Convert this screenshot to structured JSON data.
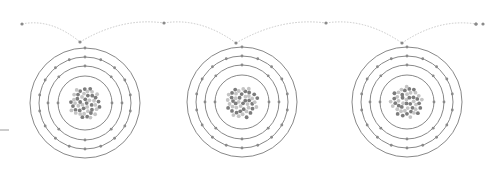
{
  "diagram": {
    "colors": {
      "background": "#ffffff",
      "orbit": "#7a7a7a",
      "path": "#c8c8c8",
      "electron": "#8a8a8a",
      "proton": "#7c7c7c",
      "neutron": "#c4c4c4"
    },
    "atoms": [
      {
        "cx": 85,
        "cy": 103
      },
      {
        "cx": 242,
        "cy": 102
      },
      {
        "cx": 407,
        "cy": 102
      }
    ],
    "shells": [
      {
        "r": 27,
        "electrons": 2
      },
      {
        "r": 37,
        "electrons": 8
      },
      {
        "r": 46,
        "electrons": 18
      },
      {
        "r": 55,
        "electrons": 1
      }
    ],
    "nucleus": {
      "r": 16,
      "particles": 46
    },
    "hop_path": {
      "start": {
        "x": 22,
        "y": 24
      },
      "points": [
        {
          "x": 80,
          "y": 42
        },
        {
          "x": 164,
          "y": 23
        },
        {
          "x": 236,
          "y": 43
        },
        {
          "x": 326,
          "y": 23
        },
        {
          "x": 402,
          "y": 43
        },
        {
          "x": 476,
          "y": 24
        }
      ],
      "end_dots": [
        {
          "x": 476,
          "y": 24
        },
        {
          "x": 483,
          "y": 24
        }
      ]
    },
    "edge_mark": {
      "x1": 0,
      "y1": 130,
      "x2": 9,
      "y2": 130
    }
  }
}
